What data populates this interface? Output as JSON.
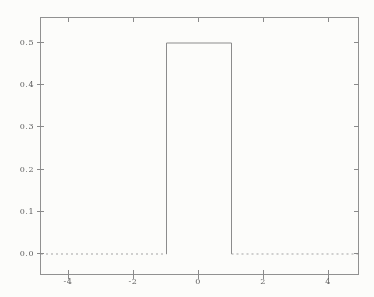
{
  "figure": {
    "background_color": "#fcfcfa",
    "frame_color": "#919191",
    "series_color": "#8c8c8c",
    "baseline_color": "#a3a3a3",
    "tick_color": "#8a8a8a",
    "label_color": "#606060"
  },
  "chart_data": {
    "type": "line",
    "title": "",
    "xlabel": "",
    "ylabel": "",
    "xlim": [
      -4.9,
      4.9
    ],
    "ylim": [
      -0.05,
      0.55
    ],
    "grid": false,
    "legend": false,
    "x_ticks": [
      -4,
      -2,
      0,
      2,
      4
    ],
    "x_tick_labels": [
      "-4",
      "-2",
      "0",
      "2",
      "4"
    ],
    "y_ticks": [
      0.0,
      0.1,
      0.2,
      0.3,
      0.4,
      0.5
    ],
    "y_tick_labels": [
      "0.0",
      "0.1",
      "0.2",
      "0.3",
      "0.4",
      "0.5"
    ],
    "series": [
      {
        "name": "rectangular pulse (uniform density on [-1,1], height 0.5)",
        "x": [
          -4.9,
          -1,
          -1,
          1,
          1,
          4.9
        ],
        "y": [
          0,
          0,
          0.5,
          0.5,
          0,
          0
        ],
        "zero_segment_style": "dotted",
        "pulse_segment_style": "solid"
      }
    ]
  }
}
